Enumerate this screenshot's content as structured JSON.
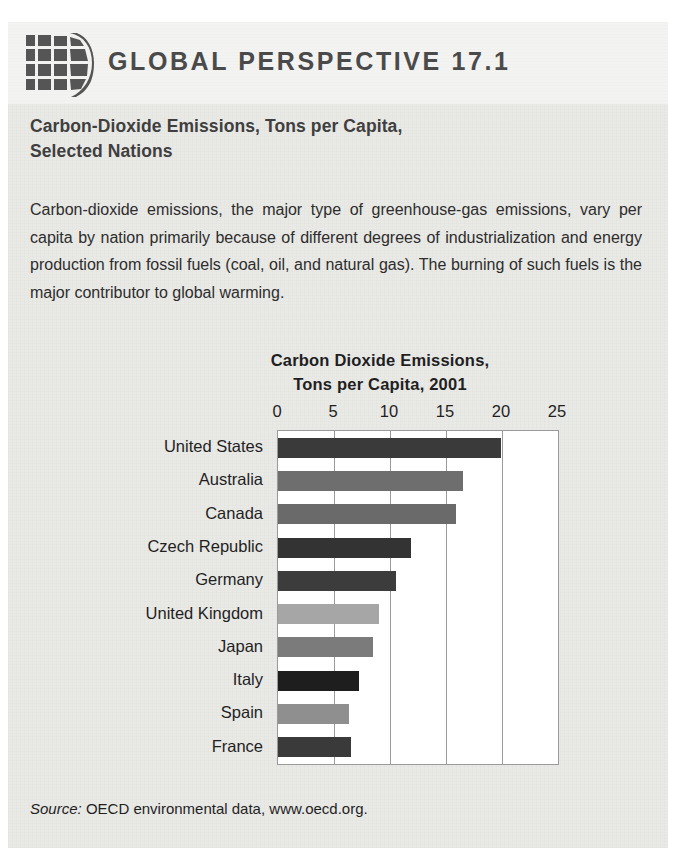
{
  "header": {
    "icon": "globe-grid-icon",
    "title": "GLOBAL PERSPECTIVE 17.1"
  },
  "box": {
    "title_line1": "Carbon-Dioxide Emissions, Tons per Capita,",
    "title_line2": "Selected Nations",
    "body": "Carbon-dioxide emissions, the major type of greenhouse-gas emissions, vary per capita by nation primarily because of different degrees of industrialization and energy production from fossil fuels (coal, oil, and natural gas). The burning of such fuels is the major contributor to global warming.",
    "source_label": "Source:",
    "source_text": "OECD environmental data, www.oecd.org."
  },
  "chart_data": {
    "type": "bar",
    "orientation": "horizontal",
    "title": "Carbon Dioxide Emissions, Tons per Capita, 2001",
    "title_line1": "Carbon Dioxide Emissions,",
    "title_line2": "Tons per Capita, 2001",
    "xlabel": "",
    "ylabel": "",
    "xlim": [
      0,
      25
    ],
    "ticks": [
      0,
      5,
      10,
      15,
      20,
      25
    ],
    "tick_labels": [
      "0",
      "5",
      "10",
      "15",
      "20",
      "25"
    ],
    "grid": true,
    "legend": null,
    "categories": [
      "United States",
      "Australia",
      "Canada",
      "Czech Republic",
      "Germany",
      "United Kingdom",
      "Japan",
      "Italy",
      "Spain",
      "France"
    ],
    "values": [
      19.9,
      16.5,
      15.9,
      11.9,
      10.5,
      9.0,
      8.5,
      7.2,
      6.3,
      6.5
    ],
    "colors": [
      "#3a3a3a",
      "#6e6e6e",
      "#6a6a6a",
      "#333333",
      "#3c3c3c",
      "#a6a6a6",
      "#7b7b7b",
      "#1e1e1e",
      "#8f8f8f",
      "#3a3a3a"
    ]
  },
  "palette": {
    "paper": "#e9e9e6",
    "header_band": "#f3f3f1",
    "header_text": "#4a4a4a",
    "plot_bg": "#ffffff",
    "grid": "#9a9a9a",
    "text": "#1f1f1f"
  }
}
